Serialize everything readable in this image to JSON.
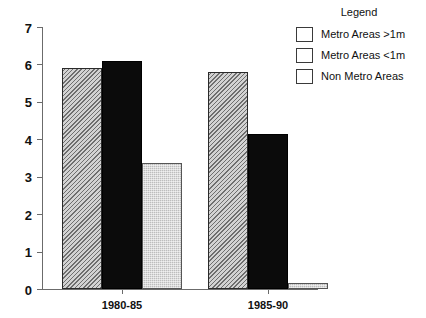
{
  "chart_data": {
    "type": "bar",
    "title": "",
    "subtitle": "",
    "xlabel": "",
    "ylabel": "",
    "categories": [
      "1980-85",
      "1985-90"
    ],
    "series": [
      {
        "name": "Metro Areas >1m",
        "values": [
          5.9,
          5.8
        ],
        "pattern": "diagonal-hatch",
        "color": "#d2d2d2"
      },
      {
        "name": "Metro Areas <1m",
        "values": [
          6.1,
          4.15
        ],
        "pattern": "solid",
        "color": "#0b0b0b"
      },
      {
        "name": "Non Metro Areas",
        "values": [
          3.38,
          0.17
        ],
        "pattern": "light-stipple",
        "color": "#bdbdbd"
      }
    ],
    "ylim": [
      0,
      7
    ],
    "yticks": [
      0,
      1,
      2,
      3,
      4,
      5,
      6,
      7
    ],
    "ytick_labels": [
      "0",
      "1",
      "2",
      "3",
      "4",
      "5",
      "6",
      "7"
    ],
    "grid": false,
    "legend_position": "top-right"
  },
  "legend": {
    "title": "Legend",
    "entries": [
      {
        "label": "Metro Areas >1m",
        "swatch": "diagonal-hatch-swatch"
      },
      {
        "label": "Metro Areas <1m",
        "swatch": "solid-black-swatch"
      },
      {
        "label": "Non Metro Areas",
        "swatch": "light-gray-swatch"
      }
    ]
  },
  "axes": {
    "y_tick_labels": [
      "7",
      "6",
      "5",
      "4",
      "3",
      "2",
      "1",
      "0"
    ],
    "x_tick_labels": [
      "1980-85",
      "1985-90"
    ]
  }
}
